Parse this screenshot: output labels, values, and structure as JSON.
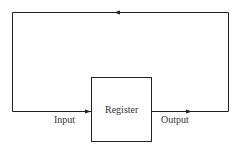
{
  "diagram": {
    "box_label": "Register",
    "input_label": "Input",
    "output_label": "Output",
    "line_color": "#222222"
  }
}
